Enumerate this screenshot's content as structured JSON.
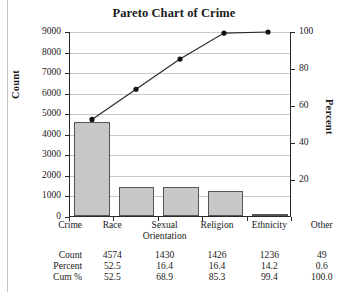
{
  "chart_data": {
    "type": "bar",
    "title": "Pareto Chart of Crime",
    "xlabel": "Crime",
    "ylabel": "Count",
    "y2label": "Percent",
    "categories": [
      "Race",
      "Sexual Orientation",
      "Religion",
      "Ethnicity",
      "Other"
    ],
    "values": [
      4574,
      1430,
      1426,
      1236,
      49
    ],
    "percent": [
      52.5,
      16.4,
      16.4,
      14.2,
      0.6
    ],
    "cum_percent": [
      52.5,
      68.9,
      85.3,
      99.4,
      100.0
    ],
    "ylim": [
      0,
      9000
    ],
    "y2lim": [
      0,
      100
    ],
    "yticks": [
      0,
      1000,
      2000,
      3000,
      4000,
      5000,
      6000,
      7000,
      8000,
      9000
    ],
    "y2ticks": [
      20,
      40,
      60,
      80,
      100
    ],
    "grid": true,
    "legend": "none",
    "series": [
      {
        "name": "Count",
        "type": "bar",
        "values": [
          4574,
          1430,
          1426,
          1236,
          49
        ]
      },
      {
        "name": "Cum %",
        "type": "line",
        "values": [
          52.5,
          68.9,
          85.3,
          99.4,
          100.0
        ]
      }
    ],
    "bar_fill": "#c8c8c8",
    "bar_edge": "#555555",
    "line_color": "#2a2a2a",
    "marker_color": "#111111"
  },
  "axes": {
    "left_title": "Count",
    "right_title": "Percent",
    "left_ticks": [
      "9000",
      "8000",
      "7000",
      "6000",
      "5000",
      "4000",
      "3000",
      "2000",
      "1000",
      "0"
    ],
    "right_ticks": [
      "100",
      "80",
      "60",
      "40",
      "20"
    ]
  },
  "table": {
    "row_labels": [
      "Crime",
      "Count",
      "Percent",
      "Cum %"
    ],
    "categories": [
      {
        "line1": "Race",
        "line2": ""
      },
      {
        "line1": "Sexual",
        "line2": "Orientation"
      },
      {
        "line1": "Religion",
        "line2": ""
      },
      {
        "line1": "Ethnicity",
        "line2": ""
      },
      {
        "line1": "Other",
        "line2": ""
      }
    ],
    "count": [
      "4574",
      "1430",
      "1426",
      "1236",
      "49"
    ],
    "percent": [
      "52.5",
      "16.4",
      "16.4",
      "14.2",
      "0.6"
    ],
    "cum": [
      "52.5",
      "68.9",
      "85.3",
      "99.4",
      "100.0"
    ]
  }
}
